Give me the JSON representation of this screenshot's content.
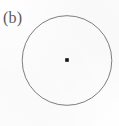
{
  "figure": {
    "domain": "diagram",
    "label": "(b)",
    "canvas": {
      "width": 119,
      "height": 126,
      "background_color": "#fefefe"
    },
    "label_style": {
      "color": "#59595b",
      "font_size_px": 16,
      "x": 3,
      "y": 9
    },
    "shapes": {
      "circle": {
        "name": "circle-outline",
        "center_x": 67,
        "center_y": 60.5,
        "radius": 44.8,
        "stroke_color": "#6f6f72",
        "stroke_width": 0.9,
        "fill": "none"
      },
      "center_point": {
        "name": "center-dot",
        "x": 67,
        "y": 60,
        "size": 3.6,
        "color": "#141414",
        "shape": "square-dot"
      }
    }
  }
}
